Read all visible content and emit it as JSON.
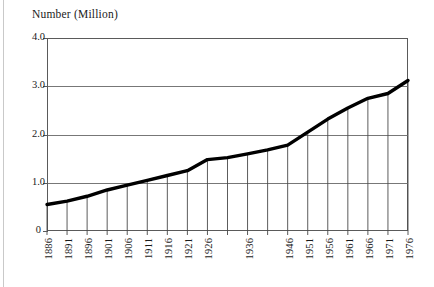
{
  "figure": {
    "axis_title": "Number (Million)",
    "line_color": "#000000",
    "grid_color": "#777777",
    "frame_color": "#5a5a5a",
    "background": "#ffffff"
  },
  "chart_data": {
    "type": "line",
    "title": "Number (Million)",
    "xlabel": "",
    "ylabel": "Number (Million)",
    "ylim": [
      0,
      4.0
    ],
    "xlim": [
      1886,
      1976
    ],
    "grid": true,
    "legend": "none",
    "y_ticks": [
      "0",
      "1.0",
      "2.0",
      "3.0",
      "4.0"
    ],
    "y_tick_values": [
      0,
      1.0,
      2.0,
      3.0,
      4.0
    ],
    "x_tick_labels": [
      "1886",
      "1891",
      "1896",
      "1901",
      "1906",
      "1911",
      "1916",
      "1921",
      "1926",
      "",
      "1936",
      "",
      "1946",
      "1951",
      "1956",
      "1961",
      "1966",
      "1971",
      "1976"
    ],
    "x": [
      1886,
      1891,
      1896,
      1901,
      1906,
      1911,
      1916,
      1921,
      1926,
      1931,
      1936,
      1941,
      1946,
      1951,
      1956,
      1961,
      1966,
      1971,
      1976
    ],
    "values": [
      0.55,
      0.62,
      0.72,
      0.85,
      0.95,
      1.05,
      1.15,
      1.25,
      1.48,
      1.52,
      1.6,
      1.68,
      1.78,
      2.05,
      2.32,
      2.55,
      2.75,
      2.85,
      3.12
    ],
    "series": [
      {
        "name": "Number (Million)",
        "values": [
          0.55,
          0.62,
          0.72,
          0.85,
          0.95,
          1.05,
          1.15,
          1.25,
          1.48,
          1.52,
          1.6,
          1.68,
          1.78,
          2.05,
          2.32,
          2.55,
          2.75,
          2.85,
          3.12
        ]
      }
    ],
    "annotations": []
  }
}
